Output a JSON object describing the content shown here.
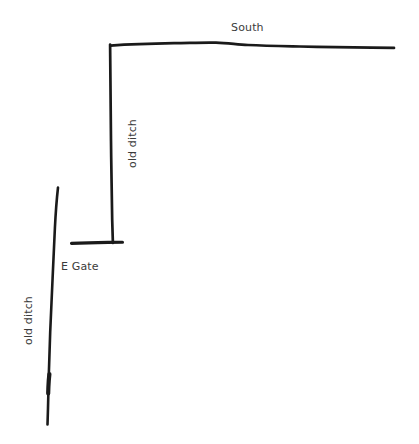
{
  "figure": {
    "kind": "hand-drawn-sketch-map",
    "background_color": "#ffffff",
    "ink_color": "#1a1a1a",
    "label_color": "#3b3b3b",
    "width": 419,
    "height": 444
  },
  "labels": {
    "south": "South",
    "e_gate": "E Gate",
    "old_ditch_centre": "old ditch",
    "old_ditch_left": "old ditch"
  },
  "features": [
    {
      "name": "south-boundary-ditch",
      "label": "South",
      "orientation": "horizontal",
      "description": "long wavy ink line running east from the corner"
    },
    {
      "name": "centre-old-ditch",
      "label": "old ditch",
      "orientation": "vertical",
      "description": "vertical ink line dropping south from the corner to the gate crossbar"
    },
    {
      "name": "e-gate-crossbar",
      "label": "E Gate",
      "orientation": "horizontal",
      "description": "short horizontal bar forming a T with the centre ditch"
    },
    {
      "name": "left-old-ditch",
      "label": "old ditch",
      "orientation": "vertical",
      "description": "slightly curving ink line on the west side of the plan"
    }
  ]
}
